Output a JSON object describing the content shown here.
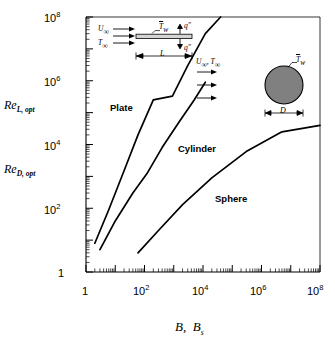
{
  "chart_data": {
    "type": "line",
    "title": "",
    "xlabel": "B,  B_s",
    "ylabel": "Re_{L,opt}   Re_{D,opt}",
    "xscale": "log",
    "yscale": "log",
    "xlim": [
      1,
      100000000.0
    ],
    "ylim": [
      1,
      100000000.0
    ],
    "grid": false,
    "legend": "inline-labels",
    "xtick_labels": [
      "1",
      "10",
      "10",
      "10",
      "10"
    ],
    "xtick_exponents": [
      "",
      "2",
      "4",
      "6",
      "8"
    ],
    "xtick_values": [
      1,
      100,
      10000,
      1000000,
      100000000
    ],
    "ytick_labels": [
      "1",
      "10",
      "10",
      "10"
    ],
    "ytick_exponents": [
      "",
      "2",
      "4",
      "8"
    ],
    "ytick_values": [
      1,
      100,
      10000,
      100000000
    ],
    "ytick_display": [
      {
        "mantissa": "10",
        "exp": "8",
        "value": 100000000
      },
      {
        "mantissa": "10",
        "exp": "6",
        "value": 1000000
      },
      {
        "mantissa": "10",
        "exp": "4",
        "value": 10000
      },
      {
        "mantissa": "10",
        "exp": "2",
        "value": 100
      },
      {
        "mantissa": "1",
        "exp": "",
        "value": 1
      }
    ],
    "xtick_display": [
      {
        "mantissa": "1",
        "exp": "",
        "value": 1
      },
      {
        "mantissa": "10",
        "exp": "2",
        "value": 100
      },
      {
        "mantissa": "10",
        "exp": "4",
        "value": 10000
      },
      {
        "mantissa": "10",
        "exp": "6",
        "value": 1000000
      },
      {
        "mantissa": "10",
        "exp": "8",
        "value": 100000000
      }
    ],
    "series": [
      {
        "name": "Plate",
        "label": "Plate",
        "color": "#000000",
        "points": [
          [
            2.0,
            8.0
          ],
          [
            6.0,
            90.0
          ],
          [
            20.0,
            1500.0
          ],
          [
            60.0,
            20000.0
          ],
          [
            200.0,
            250000.0
          ],
          [
            900.0,
            330000.0
          ],
          [
            3000.0,
            3000000.0
          ],
          [
            12000.0,
            30000000.0
          ],
          [
            40000.0,
            100000000.0
          ]
        ]
      },
      {
        "name": "Cylinder",
        "label": "Cylinder",
        "color": "#000000",
        "points": [
          [
            3.0,
            5.0
          ],
          [
            10.0,
            40.0
          ],
          [
            40.0,
            300.0
          ],
          [
            120.0,
            1200.0
          ],
          [
            400.0,
            8000.0
          ],
          [
            1500.0,
            50000.0
          ],
          [
            5000.0,
            250000.0
          ],
          [
            12000.0,
            900000.0
          ]
        ]
      },
      {
        "name": "Sphere",
        "label": "Sphere",
        "color": "#000000",
        "points": [
          [
            60.0,
            4.0
          ],
          [
            300.0,
            20.0
          ],
          [
            2000.0,
            130.0
          ],
          [
            20000.0,
            900.0
          ],
          [
            300000.0,
            6000.0
          ],
          [
            5000000.0,
            25000.0
          ],
          [
            100000000.0,
            40000.0
          ]
        ]
      }
    ]
  },
  "axes": {
    "y_label_upper": {
      "prefix": "Re",
      "sub": "L, opt"
    },
    "y_label_lower": {
      "prefix": "Re",
      "sub": "D, opt"
    },
    "x_label": {
      "first": "B,",
      "second_prefix": "B",
      "second_sub": "s"
    }
  },
  "curve_labels": {
    "plate": "Plate",
    "cylinder": "Cylinder",
    "sphere": "Sphere"
  },
  "insets": {
    "plate": {
      "name": "flat-plate-diagram",
      "u_inf": "U",
      "u_inf_sub": "∞",
      "t_inf": "T",
      "t_inf_sub": "∞",
      "wall_temp": "T",
      "wall_temp_sub": "w",
      "flux_top": "q″",
      "flux_bottom": "q″",
      "length": "L"
    },
    "sphere": {
      "name": "sphere-cylinder-diagram",
      "flow": "U",
      "flow_sub": "∞",
      "flow_t": "T",
      "flow_t_sub": "∞",
      "wall_temp": "T",
      "wall_temp_sub": "w",
      "diameter": "D",
      "fill_color": "#808080",
      "edge_color": "#000000"
    }
  },
  "colors": {
    "axis": "#000000",
    "curve": "#000000",
    "background": "#ffffff",
    "sphere_fill": "#808080"
  }
}
